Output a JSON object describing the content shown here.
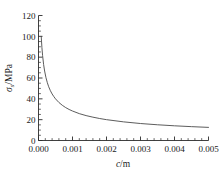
{
  "chart_data": {
    "type": "line",
    "title": "",
    "subtitle": "",
    "xlabel": "c/m",
    "ylabel": "σs/MPa",
    "xlabel_parts": {
      "symbol": "c",
      "separator": "/",
      "unit": "m"
    },
    "ylabel_parts": {
      "symbol": "σ",
      "subscript": "s",
      "separator": "/",
      "unit": "MPa"
    },
    "xlim": [
      0.0,
      0.005
    ],
    "ylim": [
      0,
      120
    ],
    "xticks": [
      0.0,
      0.001,
      0.002,
      0.003,
      0.004,
      0.005
    ],
    "xtick_labels": [
      "0.000",
      "0.001",
      "0.002",
      "0.003",
      "0.004",
      "0.005"
    ],
    "yticks": [
      0,
      20,
      40,
      60,
      80,
      100,
      120
    ],
    "ytick_labels": [
      "0",
      "20",
      "40",
      "60",
      "80",
      "100",
      "120"
    ],
    "x_minor_per_major": 5,
    "y_minor_per_major": 4,
    "grid": false,
    "legend": null,
    "legend_position": "none",
    "frame": "left-bottom",
    "series": [
      {
        "name": "σs vs c",
        "color": "#4a4a4a",
        "x": [
          8e-05,
          0.0001,
          0.00012,
          0.00015,
          0.00018,
          0.00022,
          0.00026,
          0.0003,
          0.00035,
          0.0004,
          0.00045,
          0.0005,
          0.0006,
          0.0007,
          0.0008,
          0.0009,
          0.001,
          0.0012,
          0.0014,
          0.0016,
          0.0018,
          0.002,
          0.0025,
          0.003,
          0.0035,
          0.004,
          0.0045,
          0.005
        ],
        "y": [
          100.0,
          89.4,
          81.6,
          73.0,
          66.7,
          60.3,
          55.5,
          51.6,
          47.8,
          44.7,
          42.2,
          40.0,
          36.5,
          33.8,
          31.6,
          29.8,
          28.3,
          25.8,
          23.9,
          22.4,
          21.1,
          20.0,
          17.9,
          16.3,
          15.1,
          14.1,
          13.3,
          12.6
        ]
      }
    ],
    "annotations": []
  }
}
